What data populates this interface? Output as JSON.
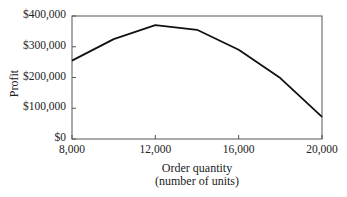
{
  "chart_data": {
    "type": "line",
    "title": "",
    "xlabel": "Order quantity (number of units)",
    "xlabel_lines": [
      "Order quantity",
      "(number of units)"
    ],
    "ylabel": "Profit",
    "x": [
      8000,
      10000,
      12000,
      14000,
      16000,
      18000,
      20000
    ],
    "series": [
      {
        "name": "Profit",
        "values": [
          255000,
          325000,
          370000,
          355000,
          290000,
          198000,
          72000
        ]
      }
    ],
    "xlim": [
      8000,
      20000
    ],
    "ylim": [
      0,
      400000
    ],
    "xticks": [
      8000,
      12000,
      16000,
      20000
    ],
    "xtick_labels": [
      "8,000",
      "12,000",
      "16,000",
      "20,000"
    ],
    "yticks": [
      0,
      100000,
      200000,
      300000,
      400000
    ],
    "ytick_labels": [
      "$0",
      "$100,000",
      "$200,000",
      "$300,000",
      "$400,000"
    ],
    "grid": false,
    "legend": "none",
    "line_color": "#111111"
  }
}
